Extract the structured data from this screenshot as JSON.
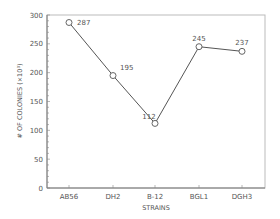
{
  "chart_data": {
    "type": "line",
    "title": "",
    "xlabel": "STRAINS",
    "ylabel": "# OF COLONIES (×10³)",
    "categories": [
      "AB56",
      "DH2",
      "B-12",
      "BGL1",
      "DGH3"
    ],
    "values": [
      287,
      195,
      112,
      245,
      237
    ],
    "data_labels": [
      "287",
      "195",
      "112",
      "245",
      "237"
    ],
    "ylim": [
      0,
      300
    ],
    "yticks": [
      "0",
      "50",
      "100",
      "150",
      "200",
      "250",
      "300"
    ],
    "grid": false,
    "legend": null,
    "marker": "open-circle",
    "line_color": "#555555"
  }
}
